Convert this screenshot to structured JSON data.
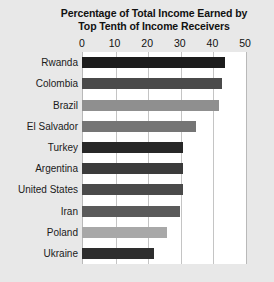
{
  "chart_data": {
    "type": "bar",
    "orientation": "horizontal",
    "title": "Percentage of Total Income Earned by Top Tenth of Income Receivers",
    "title_lines": [
      "Percentage of Total Income Earned by",
      "Top Tenth of Income Receivers"
    ],
    "xlabel": "",
    "ylabel": "",
    "xlim": [
      0,
      50
    ],
    "xticks": [
      0,
      10,
      20,
      30,
      40,
      50
    ],
    "xtick_labels": [
      "0",
      "10",
      "20",
      "30",
      "40",
      "50"
    ],
    "grid": true,
    "grid_axis": "x",
    "legend": false,
    "categories": [
      "Rwanda",
      "Colombia",
      "Brazil",
      "El Salvador",
      "Turkey",
      "Argentina",
      "United States",
      "Iran",
      "Poland",
      "Ukraine"
    ],
    "values": [
      44,
      43,
      42,
      35,
      31,
      31,
      31,
      30,
      26,
      22
    ],
    "bar_colors": [
      "#1c1c1c",
      "#4a4a4a",
      "#8f8f8f",
      "#757575",
      "#272727",
      "#3b3b3b",
      "#4a4a4a",
      "#5a5a5a",
      "#a8a8a8",
      "#2e2e2e"
    ],
    "bars": [
      {
        "label": "Rwanda",
        "value": 44,
        "color": "#1c1c1c"
      },
      {
        "label": "Colombia",
        "value": 43,
        "color": "#4a4a4a"
      },
      {
        "label": "Brazil",
        "value": 42,
        "color": "#8f8f8f"
      },
      {
        "label": "El Salvador",
        "value": 35,
        "color": "#757575"
      },
      {
        "label": "Turkey",
        "value": 31,
        "color": "#272727"
      },
      {
        "label": "Argentina",
        "value": 31,
        "color": "#3b3b3b"
      },
      {
        "label": "United States",
        "value": 31,
        "color": "#4a4a4a"
      },
      {
        "label": "Iran",
        "value": 30,
        "color": "#5a5a5a"
      },
      {
        "label": "Poland",
        "value": 26,
        "color": "#a8a8a8"
      },
      {
        "label": "Ukraine",
        "value": 22,
        "color": "#2e2e2e"
      }
    ],
    "colors": {
      "figure_background": "#e8e8e8",
      "plot_background": "#ffffff",
      "gridline": "#c4c4c4",
      "axis_frame": "#b9b9b9",
      "text": "#111111"
    }
  }
}
